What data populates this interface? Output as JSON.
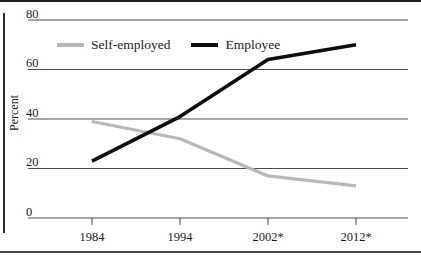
{
  "chart_data": {
    "type": "line",
    "categories": [
      "1984",
      "1994",
      "2002*",
      "2012*"
    ],
    "series": [
      {
        "name": "Self-employed",
        "values": [
          39,
          32,
          17,
          13
        ],
        "color": "#b8b8b8"
      },
      {
        "name": "Employee",
        "values": [
          23,
          41,
          64,
          70
        ],
        "color": "#0d0d0d"
      }
    ],
    "title": "",
    "xlabel": "",
    "ylabel": "Percent",
    "ylim": [
      0,
      80
    ],
    "yticks": [
      0,
      20,
      40,
      60,
      80
    ],
    "grid": true,
    "legend_position": "top-inside",
    "gridline_color": "#4d4d4d",
    "text_color": "#1a1a1a"
  }
}
